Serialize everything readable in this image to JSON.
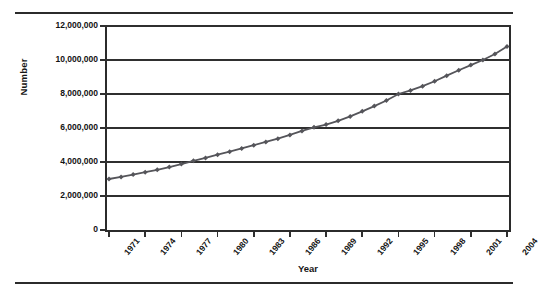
{
  "chart_data": {
    "type": "line",
    "title": "",
    "xlabel": "Year",
    "ylabel": "Number",
    "xlim": [
      1971,
      2004
    ],
    "ylim": [
      0,
      12000000
    ],
    "grid": true,
    "legend": "none",
    "marker": "diamond",
    "line_color": "#55555a",
    "marker_color": "#55555a",
    "ytick_labels": [
      "12,000,000",
      "10,000,000",
      "8,000,000",
      "6,000,000",
      "4,000,000",
      "2,000,000",
      "0"
    ],
    "ytick_values": [
      12000000,
      10000000,
      8000000,
      6000000,
      4000000,
      2000000,
      0
    ],
    "xtick_labels": [
      "1971",
      "1974",
      "1977",
      "1980",
      "1983",
      "1986",
      "1989",
      "1992",
      "1995",
      "1998",
      "2001",
      "2004"
    ],
    "xtick_values": [
      1971,
      1974,
      1977,
      1980,
      1983,
      1986,
      1989,
      1992,
      1995,
      1998,
      2001,
      2004
    ],
    "x": [
      1971,
      1972,
      1973,
      1974,
      1975,
      1976,
      1977,
      1978,
      1979,
      1980,
      1981,
      1982,
      1983,
      1984,
      1985,
      1986,
      1987,
      1988,
      1989,
      1990,
      1991,
      1992,
      1993,
      1994,
      1995,
      1996,
      1997,
      1998,
      1999,
      2000,
      2001,
      2002,
      2003,
      2004
    ],
    "values": [
      3000000,
      3120000,
      3260000,
      3400000,
      3540000,
      3700000,
      3880000,
      4070000,
      4240000,
      4430000,
      4610000,
      4800000,
      4990000,
      5180000,
      5370000,
      5590000,
      5830000,
      6040000,
      6200000,
      6420000,
      6680000,
      6980000,
      7290000,
      7620000,
      8000000,
      8210000,
      8460000,
      8750000,
      9080000,
      9400000,
      9700000,
      10000000,
      10350000,
      10800000
    ],
    "series": [
      {
        "name": "Number",
        "values": [
          3000000,
          3120000,
          3260000,
          3400000,
          3540000,
          3700000,
          3880000,
          4070000,
          4240000,
          4430000,
          4610000,
          4800000,
          4990000,
          5180000,
          5370000,
          5590000,
          5830000,
          6040000,
          6200000,
          6420000,
          6680000,
          6980000,
          7290000,
          7620000,
          8000000,
          8210000,
          8460000,
          8750000,
          9080000,
          9400000,
          9700000,
          10000000,
          10350000,
          10800000
        ]
      }
    ]
  }
}
